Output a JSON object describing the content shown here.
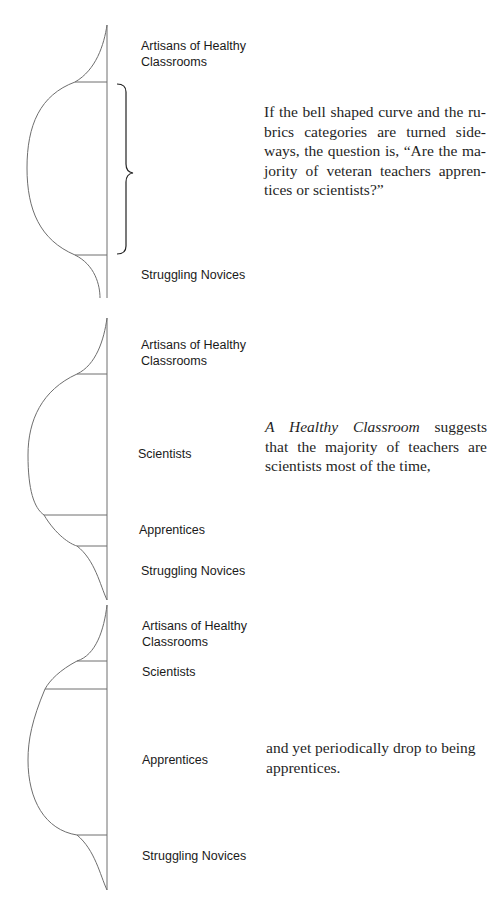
{
  "panels": [
    {
      "labels": {
        "artisans": "Artisans of Healthy Classrooms",
        "artisans_line1": "Artisans of Healthy",
        "artisans_line2": "Classrooms",
        "novices": "Struggling Novices"
      },
      "text": "If the bell shaped curve and the rubrics categories are turned sideways, the question is, “Are the majority of veteran teachers apprentices or scientists?”",
      "text_lines": [
        "If the bell shaped curve and the ru-",
        "brics categories are turned side-",
        "ways, the question is, “Are the ma-",
        "jority of veteran teachers appren-",
        "tices or scientists?”"
      ]
    },
    {
      "labels": {
        "artisans_line1": "Artisans of Healthy",
        "artisans_line2": "Classrooms",
        "scientists": "Scientists",
        "apprentices": "Apprentices",
        "novices": "Struggling Novices"
      },
      "text_italic": "A Healthy Classroom",
      "text_rest_line1": " suggests",
      "text_lines_rest": [
        "that the majority of teachers are",
        "scientists most of the time,"
      ]
    },
    {
      "labels": {
        "artisans_line1": "Artisans of Healthy",
        "artisans_line2": "Classrooms",
        "scientists": "Scientists",
        "apprentices": "Apprentices",
        "novices": "Struggling Novices"
      },
      "text_lines": [
        "and yet periodically drop to being",
        "apprentices."
      ]
    }
  ]
}
